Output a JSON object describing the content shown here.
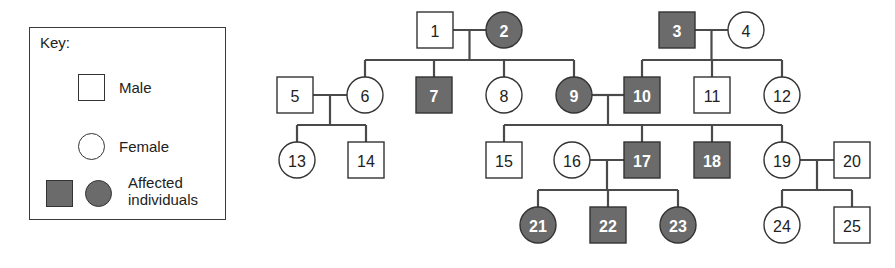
{
  "key": {
    "title": "Key:",
    "male_label": "Male",
    "female_label": "Female",
    "affected_label_line1": "Affected",
    "affected_label_line2": "individuals"
  },
  "colors": {
    "affected_fill": "#6b6b6b",
    "unaffected_fill": "#ffffff",
    "line": "#4a4a4a",
    "affected_text": "#ffffff",
    "unaffected_text": "#222222"
  },
  "individuals": [
    {
      "id": "1",
      "sex": "male",
      "affected": false,
      "x": 435,
      "y": 30
    },
    {
      "id": "2",
      "sex": "female",
      "affected": true,
      "x": 504,
      "y": 30
    },
    {
      "id": "3",
      "sex": "male",
      "affected": true,
      "x": 677,
      "y": 30
    },
    {
      "id": "4",
      "sex": "female",
      "affected": false,
      "x": 746,
      "y": 30
    },
    {
      "id": "5",
      "sex": "male",
      "affected": false,
      "x": 295,
      "y": 95
    },
    {
      "id": "6",
      "sex": "female",
      "affected": false,
      "x": 365,
      "y": 95
    },
    {
      "id": "7",
      "sex": "male",
      "affected": true,
      "x": 434,
      "y": 95
    },
    {
      "id": "8",
      "sex": "female",
      "affected": false,
      "x": 504,
      "y": 95
    },
    {
      "id": "9",
      "sex": "female",
      "affected": true,
      "x": 574,
      "y": 95
    },
    {
      "id": "10",
      "sex": "male",
      "affected": true,
      "x": 642,
      "y": 95
    },
    {
      "id": "11",
      "sex": "male",
      "affected": false,
      "x": 712,
      "y": 95
    },
    {
      "id": "12",
      "sex": "female",
      "affected": false,
      "x": 782,
      "y": 95
    },
    {
      "id": "13",
      "sex": "female",
      "affected": false,
      "x": 297,
      "y": 160
    },
    {
      "id": "14",
      "sex": "male",
      "affected": false,
      "x": 366,
      "y": 160
    },
    {
      "id": "15",
      "sex": "male",
      "affected": false,
      "x": 504,
      "y": 160
    },
    {
      "id": "16",
      "sex": "female",
      "affected": false,
      "x": 572,
      "y": 160
    },
    {
      "id": "17",
      "sex": "male",
      "affected": true,
      "x": 642,
      "y": 160
    },
    {
      "id": "18",
      "sex": "male",
      "affected": true,
      "x": 712,
      "y": 160
    },
    {
      "id": "19",
      "sex": "female",
      "affected": false,
      "x": 782,
      "y": 160
    },
    {
      "id": "20",
      "sex": "male",
      "affected": false,
      "x": 852,
      "y": 160
    },
    {
      "id": "21",
      "sex": "female",
      "affected": true,
      "x": 538,
      "y": 225
    },
    {
      "id": "22",
      "sex": "male",
      "affected": true,
      "x": 608,
      "y": 225
    },
    {
      "id": "23",
      "sex": "female",
      "affected": true,
      "x": 678,
      "y": 225
    },
    {
      "id": "24",
      "sex": "female",
      "affected": false,
      "x": 782,
      "y": 225
    },
    {
      "id": "25",
      "sex": "male",
      "affected": false,
      "x": 852,
      "y": 225
    }
  ],
  "matings": [
    {
      "partners": [
        "1",
        "2"
      ],
      "children": [
        "6",
        "7",
        "8",
        "9"
      ]
    },
    {
      "partners": [
        "3",
        "4"
      ],
      "children": [
        "10",
        "11",
        "12"
      ]
    },
    {
      "partners": [
        "5",
        "6"
      ],
      "children": [
        "13",
        "14"
      ]
    },
    {
      "partners": [
        "9",
        "10"
      ],
      "children": [
        "15",
        "17",
        "18",
        "19"
      ]
    },
    {
      "partners": [
        "16",
        "17"
      ],
      "children": [
        "21",
        "22",
        "23"
      ]
    },
    {
      "partners": [
        "19",
        "20"
      ],
      "children": [
        "24",
        "25"
      ]
    }
  ]
}
